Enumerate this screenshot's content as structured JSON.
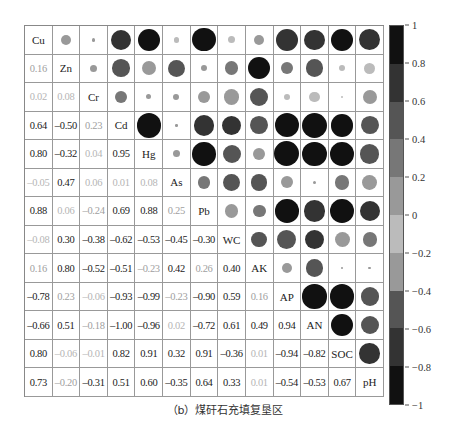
{
  "chart_data": {
    "type": "heatmap",
    "subtype": "correlation-matrix (lower: coefficients, upper: circles sized/shaded by |r|)",
    "title": "",
    "caption": "（b）煤矸石充填复垦区",
    "variables": [
      "Cu",
      "Zn",
      "Cr",
      "Cd",
      "Hg",
      "As",
      "Pb",
      "WC",
      "AK",
      "AP",
      "AN",
      "SOC",
      "pH"
    ],
    "matrix": [
      [
        1,
        0.16,
        0.02,
        0.64,
        0.8,
        -0.05,
        0.88,
        -0.08,
        0.16,
        -0.78,
        -0.66,
        0.8,
        0.73
      ],
      [
        0.16,
        1,
        0.08,
        -0.5,
        -0.32,
        0.47,
        0.06,
        0.3,
        0.8,
        0.23,
        0.51,
        -0.06,
        -0.2
      ],
      [
        0.02,
        0.08,
        1,
        0.23,
        0.04,
        0.06,
        -0.24,
        -0.38,
        -0.52,
        -0.06,
        -0.18,
        -0.01,
        -0.31
      ],
      [
        0.64,
        -0.5,
        0.23,
        1,
        0.95,
        0.01,
        0.69,
        -0.62,
        -0.51,
        -0.93,
        -1.0,
        0.82,
        0.51
      ],
      [
        0.8,
        -0.32,
        0.04,
        0.95,
        1,
        0.08,
        0.88,
        -0.53,
        -0.23,
        -0.99,
        -0.96,
        0.91,
        0.6
      ],
      [
        -0.05,
        0.47,
        0.06,
        0.01,
        0.08,
        1,
        0.25,
        -0.45,
        0.42,
        -0.23,
        0.02,
        0.32,
        -0.35
      ],
      [
        0.88,
        0.06,
        -0.24,
        0.69,
        0.88,
        0.25,
        1,
        -0.3,
        0.26,
        -0.9,
        -0.72,
        0.91,
        0.64
      ],
      [
        -0.08,
        0.3,
        -0.38,
        -0.62,
        -0.53,
        -0.45,
        -0.3,
        1,
        0.4,
        0.59,
        0.61,
        -0.36,
        0.33
      ],
      [
        0.16,
        0.8,
        -0.52,
        -0.51,
        -0.23,
        0.42,
        0.26,
        0.4,
        1,
        0.16,
        0.49,
        0.01,
        0.01
      ],
      [
        -0.78,
        0.23,
        -0.06,
        -0.93,
        -0.99,
        -0.23,
        -0.9,
        0.59,
        0.16,
        1,
        0.94,
        -0.94,
        -0.54
      ],
      [
        -0.66,
        0.51,
        -0.18,
        -1.0,
        -0.96,
        0.02,
        -0.72,
        0.61,
        0.49,
        0.94,
        1,
        -0.82,
        -0.53
      ],
      [
        0.8,
        -0.06,
        -0.01,
        0.82,
        0.91,
        0.32,
        0.91,
        -0.36,
        0.01,
        -0.94,
        -0.82,
        1,
        0.67
      ],
      [
        0.73,
        -0.2,
        -0.31,
        0.51,
        0.6,
        -0.35,
        0.64,
        0.33,
        0.01,
        -0.54,
        -0.53,
        0.67,
        1
      ]
    ],
    "colorbar": {
      "range": [
        -1,
        1
      ],
      "ticks": [
        "1",
        "0.8",
        "0.6",
        "0.4",
        "0.2",
        "0",
        "-0.2",
        "-0.4",
        "-0.6",
        "-0.8",
        "-1"
      ],
      "bins_top_to_bottom": [
        "#111111",
        "#333333",
        "#555555",
        "#777777",
        "#999999",
        "#bbbbbb",
        "#999999",
        "#555555",
        "#333333",
        "#111111"
      ]
    },
    "grid": true,
    "legend_position": "right"
  }
}
